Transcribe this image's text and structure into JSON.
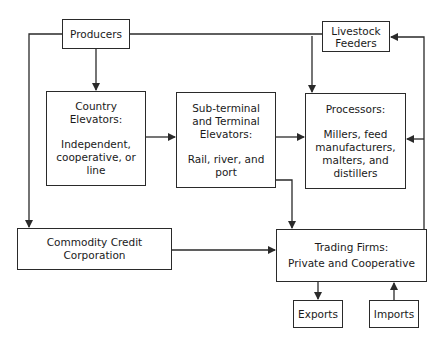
{
  "diagram": {
    "nodes": {
      "producers": {
        "label": "Producers"
      },
      "livestock": {
        "label": "Livestock Feeders"
      },
      "country": {
        "title": "Country Elevators:",
        "sub": "Independent, cooperative, or line"
      },
      "subterminal": {
        "title": "Sub-terminal and Terminal Elevators:",
        "sub": "Rail, river, and port"
      },
      "processors": {
        "title": "Processors:",
        "sub": "Millers, feed manufacturers, malters, and distillers"
      },
      "ccc": {
        "label": "Commodity Credit Corporation"
      },
      "trading": {
        "title": "Trading Firms:",
        "sub": "Private and Cooperative"
      },
      "exports": {
        "label": "Exports"
      },
      "imports": {
        "label": "Imports"
      }
    },
    "edges": [
      {
        "from": "Producers",
        "to": "Country Elevators"
      },
      {
        "from": "Producers",
        "to": "Processors"
      },
      {
        "from": "Producers",
        "to": "Commodity Credit Corporation"
      },
      {
        "from": "Livestock Feeders",
        "to": "Processors"
      },
      {
        "from": "Country Elevators",
        "to": "Sub-terminal and Terminal Elevators"
      },
      {
        "from": "Sub-terminal and Terminal Elevators",
        "to": "Processors"
      },
      {
        "from": "Sub-terminal and Terminal Elevators",
        "to": "Trading Firms"
      },
      {
        "from": "Commodity Credit Corporation",
        "to": "Trading Firms"
      },
      {
        "from": "Trading Firms",
        "to": "Processors"
      },
      {
        "from": "Trading Firms",
        "to": "Livestock Feeders"
      },
      {
        "from": "Trading Firms",
        "to": "Exports"
      },
      {
        "from": "Imports",
        "to": "Trading Firms"
      }
    ]
  }
}
